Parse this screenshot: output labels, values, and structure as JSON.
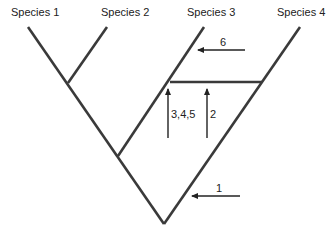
{
  "diagram": {
    "type": "phylogenetic-tree",
    "species": [
      {
        "label": "Species 1"
      },
      {
        "label": "Species 2"
      },
      {
        "label": "Species 3"
      },
      {
        "label": "Species 4"
      }
    ],
    "arrows": [
      {
        "label": "6",
        "direction": "left"
      },
      {
        "label": "3,4,5",
        "direction": "up"
      },
      {
        "label": "2",
        "direction": "up"
      },
      {
        "label": "1",
        "direction": "left"
      }
    ],
    "colors": {
      "line": "#3a3a3a",
      "arrow": "#222222",
      "background": "#ffffff"
    }
  }
}
